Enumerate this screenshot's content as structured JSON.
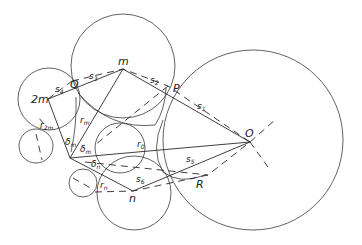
{
  "diagram": {
    "labels": {
      "O": "O",
      "m": "m",
      "two_m": "2m",
      "n": "n",
      "P": "P",
      "Q": "Q",
      "R": "R",
      "s1": "s",
      "s1_sub": "1",
      "s2": "s",
      "s2_sub": "2",
      "s3": "s",
      "s3_sub": "3",
      "s4": "s",
      "s4_sub": "4",
      "s5": "s",
      "s5_sub": "5",
      "s6": "s",
      "s6_sub": "6",
      "r0": "r",
      "r0_sub": "0",
      "rm": "r",
      "rm_sub": "m",
      "r2m": "r",
      "r2m_sub": "2m",
      "rn": "r",
      "rn_sub": "n",
      "delta_m_1": "δ",
      "delta_m_1_sub": "m",
      "delta_m_2": "δ",
      "delta_m_2_sub": "m",
      "delta_n": "δ",
      "delta_n_sub": "n"
    }
  }
}
